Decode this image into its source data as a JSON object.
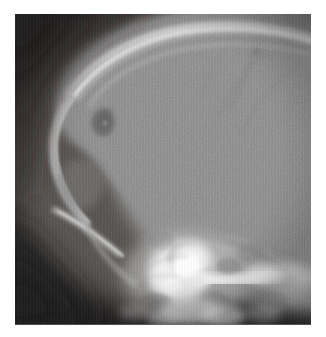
{
  "figure": {
    "kind": "radiograph",
    "modality": "X-ray",
    "view": "lateral skull",
    "caption": ""
  },
  "plate": {
    "background_color": "#201e1e",
    "bone_color": "#8c8c8c",
    "dense_bone_color": "#f2f2f2",
    "lesion_color": "#6b6b6b",
    "soft_tissue_color": "#4a4846"
  },
  "anatomy": {
    "regions": [
      {
        "name": "background",
        "label": "Film background",
        "tone": "#1f1d1d"
      },
      {
        "name": "calvarium",
        "label": "Calvarial vault",
        "tone": "#8c8c8c"
      },
      {
        "name": "outer-table",
        "label": "Outer table / scalp margin",
        "tone": "#cfcfcf"
      },
      {
        "name": "frontal-bone",
        "label": "Frontal bone",
        "tone": "#b3b3b3"
      },
      {
        "name": "lucent-lesion",
        "label": "Rounded lucent lesion",
        "tone": "#6d6d6d"
      },
      {
        "name": "skull-base",
        "label": "Skull base / petrous bone",
        "tone": "#fbfbfb"
      },
      {
        "name": "facial-bones",
        "label": "Facial bones",
        "tone": "#9a9a9a"
      },
      {
        "name": "occiput",
        "label": "Occipital region",
        "tone": "#8f8f8f"
      }
    ],
    "lesion": {
      "name": "lucent-lesion",
      "center_x_px": 103,
      "center_y_px": 122,
      "diameter_px": 26,
      "description": "Rounded lucency in frontal calvarium"
    }
  }
}
